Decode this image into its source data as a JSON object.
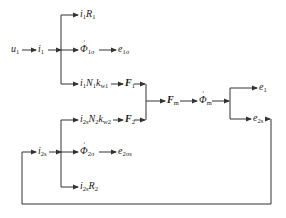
{
  "diagram": {
    "type": "signal-flow",
    "nodes": {
      "u1": {
        "main": "u",
        "sub": "1"
      },
      "i1": {
        "main": "i",
        "sub": "1"
      },
      "i1R1": {
        "parts": [
          [
            "i",
            "1"
          ],
          [
            "R",
            "1"
          ]
        ]
      },
      "phi1s": {
        "main": "Φ",
        "sub": "1σ",
        "dot": true
      },
      "e1s": {
        "main": "e",
        "sub": "1σ"
      },
      "i1N1kw1": {
        "parts": [
          [
            "i",
            "1"
          ],
          [
            "N",
            "1"
          ],
          [
            "k",
            "w1"
          ]
        ]
      },
      "F1": {
        "main": "F",
        "sub": "1"
      },
      "F2": {
        "main": "F",
        "sub": "2"
      },
      "Fm": {
        "main": "F",
        "sub": "m"
      },
      "phim": {
        "main": "Φ",
        "sub": "m",
        "dot": true
      },
      "e1": {
        "main": "e",
        "sub": "1"
      },
      "e2s": {
        "main": "e",
        "sub": "2s"
      },
      "i2sN2kw2": {
        "parts": [
          [
            "i",
            "2s"
          ],
          [
            "N",
            "2"
          ],
          [
            "k",
            "w2"
          ]
        ]
      },
      "i2s": {
        "main": "i",
        "sub": "2s"
      },
      "phi2s": {
        "main": "Φ",
        "sub": "2σ",
        "dot": true
      },
      "e2ss": {
        "main": "e",
        "sub": "2σs"
      },
      "i2sR2": {
        "parts": [
          [
            "i",
            "2s"
          ],
          [
            "R",
            "2"
          ]
        ]
      }
    },
    "edges": [
      [
        "u1",
        "i1"
      ],
      [
        "i1",
        "i1R1"
      ],
      [
        "i1",
        "phi1s"
      ],
      [
        "i1",
        "i1N1kw1"
      ],
      [
        "phi1s",
        "e1s"
      ],
      [
        "i1N1kw1",
        "F1"
      ],
      [
        "F1",
        "Fm"
      ],
      [
        "F2",
        "Fm"
      ],
      [
        "Fm",
        "phim"
      ],
      [
        "phim",
        "e1"
      ],
      [
        "phim",
        "e2s"
      ],
      [
        "e2s",
        "i2s"
      ],
      [
        "i2s",
        "i2sN2kw2"
      ],
      [
        "i2s",
        "phi2s"
      ],
      [
        "i2s",
        "i2sR2"
      ],
      [
        "phi2s",
        "e2ss"
      ],
      [
        "i2sN2kw2",
        "F2"
      ]
    ]
  }
}
